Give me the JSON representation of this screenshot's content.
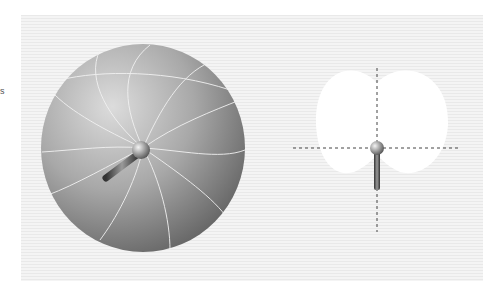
{
  "edge_fragment": "s",
  "figures": [
    {
      "name": "3d-polar-pattern",
      "description": "Omnidirectional 3D polar pickup pattern (sphere) with microphone at center"
    },
    {
      "name": "2d-cardioid-pattern",
      "description": "Cardioid 2D polar pattern with crosshair axes and microphone at center"
    }
  ],
  "colors": {
    "background": "#ffffff",
    "panel": "#efefef",
    "sphere_light": "#d8d8d8",
    "sphere_dark": "#6a6a6a",
    "cardioid": "#ffffff",
    "axis": "#444444"
  }
}
